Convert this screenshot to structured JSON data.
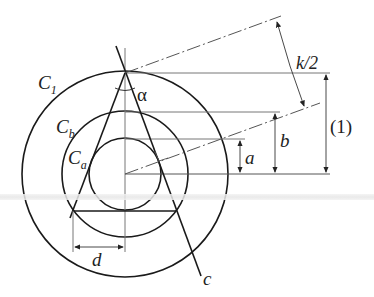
{
  "diagram": {
    "labels": {
      "c1": "C",
      "c1_sub": "1",
      "cb": "C",
      "cb_sub": "b",
      "ca": "C",
      "ca_sub": "a",
      "alpha": "α",
      "k_half": "k/2",
      "one": "(1)",
      "a": "a",
      "b": "b",
      "d": "d",
      "c": "c"
    },
    "colors": {
      "stroke": "#1a1a1a",
      "thin": "#555555",
      "band": "#e6e6e6"
    }
  }
}
